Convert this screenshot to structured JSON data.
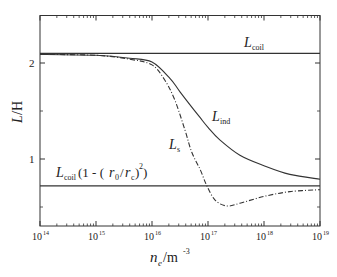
{
  "chart_data": {
    "type": "line",
    "title": "",
    "xlabel": "n_e / m^-3",
    "ylabel": "L / H",
    "xscale": "log",
    "xlim": [
      100000000000000.0,
      1e+19
    ],
    "ylim": [
      0.3,
      2.5
    ],
    "grid": false,
    "legend": "none (inline curve labels)",
    "x_ticks": [
      {
        "value": 14,
        "label": "10",
        "exp": "14"
      },
      {
        "value": 15,
        "label": "10",
        "exp": "15"
      },
      {
        "value": 16,
        "label": "10",
        "exp": "16"
      },
      {
        "value": 17,
        "label": "10",
        "exp": "17"
      },
      {
        "value": 18,
        "label": "10",
        "exp": "18"
      },
      {
        "value": 19,
        "label": "10",
        "exp": "19"
      }
    ],
    "y_ticks": [
      {
        "value": 1,
        "label": "1"
      },
      {
        "value": 2,
        "label": "2"
      }
    ],
    "y_minor_ticks": [
      0.5,
      1.5
    ],
    "series": [
      {
        "name": "L_coil",
        "style": "solid",
        "log10_x": [
          14,
          19
        ],
        "values": [
          2.1,
          2.1
        ]
      },
      {
        "name": "L_coil(1 - (r_0/r_c)^2)",
        "style": "solid",
        "log10_x": [
          14,
          19
        ],
        "values": [
          0.72,
          0.72
        ]
      },
      {
        "name": "L_ind",
        "style": "solid",
        "log10_x": [
          14,
          15,
          15.6,
          16,
          16.32,
          16.5,
          16.86,
          17,
          17.21,
          17.57,
          18,
          18.46,
          19
        ],
        "values": [
          2.09,
          2.08,
          2.05,
          2.01,
          1.84,
          1.7,
          1.43,
          1.33,
          1.2,
          1.04,
          0.93,
          0.84,
          0.79
        ]
      },
      {
        "name": "L_s",
        "style": "dash-dot",
        "log10_x": [
          14,
          15,
          15.6,
          16,
          16.23,
          16.41,
          16.59,
          16.71,
          16.86,
          16.98,
          17.13,
          17.34,
          17.57,
          18,
          18.46,
          19
        ],
        "values": [
          2.09,
          2.08,
          2.04,
          1.98,
          1.82,
          1.61,
          1.3,
          1.07,
          0.89,
          0.72,
          0.57,
          0.51,
          0.54,
          0.61,
          0.66,
          0.68
        ]
      }
    ],
    "annotations": [
      {
        "text": "L",
        "sub": "coil",
        "near": "L_coil line"
      },
      {
        "text": "L",
        "sub": "ind",
        "near": "L_ind curve"
      },
      {
        "text": "L",
        "sub": "s",
        "near": "L_s curve"
      },
      {
        "text": "L_coil (1 - (r_0/r_c)^2)",
        "near": "lower horizontal line"
      }
    ]
  },
  "labels": {
    "xlabel_main": "n",
    "xlabel_sub": "e",
    "xlabel_unit": "/m",
    "xlabel_exp": "-3",
    "ylabel_italic": "L",
    "ylabel_unit": "/H",
    "lcoil_main": "L",
    "lcoil_sub": "coil",
    "lind_main": "L",
    "lind_sub": "ind",
    "ls_main": "L",
    "ls_sub": "s",
    "lower_main": "L",
    "lower_sub": "coil",
    "lower_paren_open": "(1 - (",
    "lower_r0": "r",
    "lower_r0_sub": "0",
    "lower_slash": "/",
    "lower_rc": "r",
    "lower_rc_sub": "c",
    "lower_close": ")",
    "lower_exp": "2",
    "lower_end": ")"
  }
}
